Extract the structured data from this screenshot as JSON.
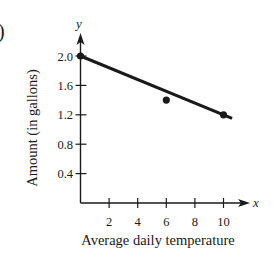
{
  "part_label": ")",
  "chart_data": {
    "type": "scatter",
    "title": "",
    "xlabel": "Average daily temperature",
    "ylabel": "Amount (in gallons)",
    "x_axis_var": "x",
    "y_axis_var": "y",
    "x_ticks": [
      2,
      4,
      6,
      8,
      10
    ],
    "y_ticks": [
      "0.4",
      "0.8",
      "1.2",
      "1.6",
      "2.0"
    ],
    "xlim": [
      0,
      11
    ],
    "ylim": [
      0,
      2.2
    ],
    "grid": false,
    "legend": null,
    "series": [
      {
        "name": "data points",
        "type": "scatter",
        "x": [
          0,
          6,
          10
        ],
        "y": [
          2.0,
          1.4,
          1.2
        ]
      },
      {
        "name": "trend line",
        "type": "line",
        "x": [
          0,
          10.6
        ],
        "y": [
          2.0,
          1.15
        ]
      }
    ],
    "colors": {
      "ink": "#1a1a1a",
      "background": "#ffffff"
    }
  }
}
